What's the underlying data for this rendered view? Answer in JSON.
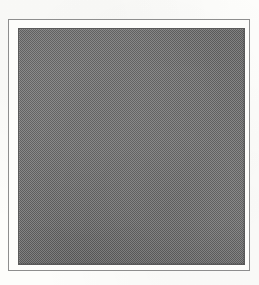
{
  "document": {
    "kind": "scanned-figure-plate",
    "page_background": "#fdfdfb",
    "canvas": {
      "width": 259,
      "height": 285
    }
  },
  "figure": {
    "frame": {
      "name": "figure-border",
      "color": "#8e8e8e",
      "stroke_width": 1,
      "left": 8,
      "top": 19,
      "width": 242,
      "height": 252
    },
    "plate": {
      "name": "image-plate",
      "fill": "#6e6e6e",
      "edge_color": "#5a5a5a",
      "texture": "halftone-dither",
      "left": 17,
      "top": 27,
      "width": 227,
      "height": 237
    },
    "caption": "",
    "label": "",
    "content_text": ""
  }
}
